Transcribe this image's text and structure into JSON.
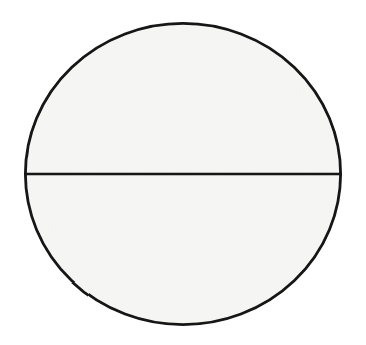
{
  "canvas": {
    "width": 366,
    "height": 345,
    "background_color": "#ffffff",
    "description": "Plain white page containing a single hand-drawn geometric figure; no text, labels, axes or UI chrome are present."
  },
  "figure": {
    "name": "circle-with-diameter",
    "kind": "geometric-line-drawing",
    "stroke_color": "#141414",
    "fill_color": "#f6f6f4",
    "stroke_width": 2.6,
    "rendering": "hand-drawn / scanned, slightly irregular outline"
  },
  "shapes": {
    "circle": {
      "label": "circle-outline",
      "center_x": 183,
      "center_y": 174,
      "radius_x": 159,
      "radius_y": 152,
      "bounds": {
        "left": 24,
        "top": 22,
        "right": 342,
        "bottom": 326
      },
      "fill_color": "#f6f6f4",
      "stroke_color": "#141414",
      "stroke_width": 2.8
    },
    "diameter": {
      "label": "horizontal-diameter-line",
      "x1": 24,
      "y1": 174,
      "x2": 342,
      "y2": 174,
      "orientation": "horizontal",
      "stroke_color": "#141414",
      "stroke_width": 2.6,
      "divides_into": 2,
      "parts": [
        "upper-semicircle",
        "lower-semicircle"
      ]
    }
  },
  "regions": [
    {
      "name": "upper-semicircle",
      "position": "above the diameter",
      "fill_color": "#f6f6f4"
    },
    {
      "name": "lower-semicircle",
      "position": "below the diameter",
      "fill_color": "#f6f6f4"
    }
  ],
  "text_content": {
    "labels": [],
    "note": "no visible text in the image"
  }
}
